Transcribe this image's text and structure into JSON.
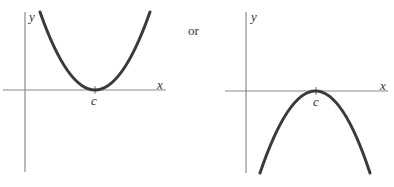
{
  "figure": {
    "connector_text": "or",
    "left_graph": {
      "y_axis_label": "y",
      "x_axis_label": "x",
      "vertex_label": "c",
      "shape": "upward-opening parabola with minimum at x = c on the x-axis"
    },
    "right_graph": {
      "y_axis_label": "y",
      "x_axis_label": "x",
      "vertex_label": "c",
      "shape": "downward-opening parabola with maximum at x = c on the x-axis"
    },
    "colors": {
      "axis": "#8a8a8a",
      "curve": "#3a3a3a",
      "text": "#333333"
    }
  }
}
